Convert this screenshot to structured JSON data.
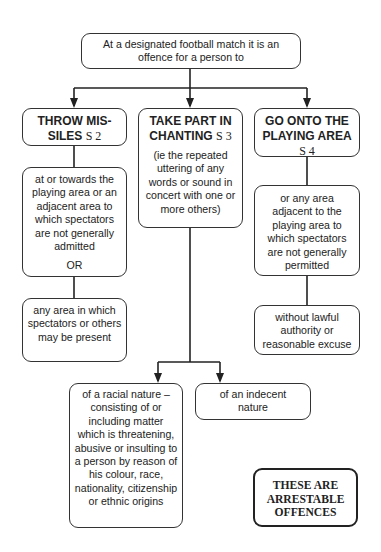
{
  "root": {
    "text": "At a designated football match it is an offence for a person to"
  },
  "branches": [
    {
      "title": "THROW MIS-SILES",
      "title_line1": "THROW MIS-",
      "title_line2": "SILES",
      "section": "S 2",
      "children": [
        {
          "text": "at or towards the playing area or an adjacent area to which spectators are not generally admitted",
          "connector": "OR"
        },
        {
          "text": "any area in which spectators or others may be present"
        }
      ]
    },
    {
      "title": "TAKE PART IN CHANTING",
      "title_line1": "TAKE PART IN",
      "title_line2": "CHANTING",
      "section": "S 3",
      "note": "(ie the repeated uttering of any words or sound in concert with one or more others)",
      "children": [
        {
          "text": "of a racial nature – consisting of or including matter which is threatening, abusive or insulting to a person by reason of his colour, race, nationality, citizenship or ethnic origins"
        },
        {
          "text": "of an indecent nature"
        }
      ]
    },
    {
      "title": "GO ONTO THE PLAYING AREA",
      "title_line1": "GO ONTO THE",
      "title_line2": "PLAYING AREA",
      "section": "S 4",
      "children": [
        {
          "text": "or any area adjacent to the playing area to which spectators are not generally permitted"
        },
        {
          "text": "without lawful authority or reasonable excuse"
        }
      ]
    }
  ],
  "footer_note": {
    "line1": "THESE ARE",
    "line2": "ARRESTABLE",
    "line3": "OFFENCES"
  },
  "colors": {
    "line": "#222222",
    "border": "#333333",
    "background": "#ffffff"
  }
}
